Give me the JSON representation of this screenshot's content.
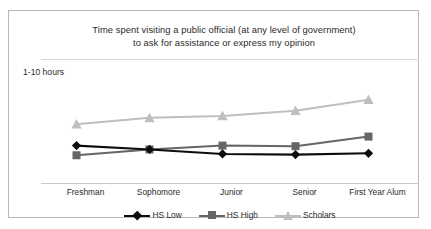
{
  "chart_data": {
    "type": "line",
    "title": "Time spent visiting a public official (at any level of government) to ask for assistance or express my opinion",
    "title_line1": "Time spent visiting a public official (at any level of government)",
    "title_line2": "to ask for assistance or express my opinion",
    "ylabel": "1-10 hours",
    "xlabel": "",
    "grid": false,
    "legend_position": "bottom",
    "ylim": [
      1,
      10
    ],
    "categories": [
      "Freshman",
      "Sophomore",
      "Junior",
      "Senior",
      "First Year Alum"
    ],
    "series": [
      {
        "name": "HS Low",
        "color": "#0d0d0d",
        "marker": "diamond",
        "values": [
          3.05,
          2.75,
          2.4,
          2.35,
          2.45
        ]
      },
      {
        "name": "HS High",
        "color": "#666666",
        "marker": "square",
        "values": [
          2.3,
          2.75,
          3.05,
          3.0,
          3.75
        ]
      },
      {
        "name": "Scholars",
        "color": "#bfbfbf",
        "marker": "triangle",
        "values": [
          4.7,
          5.2,
          5.35,
          5.75,
          6.6
        ]
      }
    ]
  },
  "axis": {
    "x_tick_labels": [
      "Freshman",
      "Sophomore",
      "Junior",
      "Senior",
      "First Year Alum"
    ]
  },
  "legend": {
    "entries": [
      {
        "label": "HS Low",
        "color": "#0d0d0d",
        "marker": "diamond"
      },
      {
        "label": "HS High",
        "color": "#666666",
        "marker": "square"
      },
      {
        "label": "Scholars",
        "color": "#bfbfbf",
        "marker": "triangle"
      }
    ]
  },
  "colors": {
    "hs_low": "#0d0d0d",
    "hs_high": "#666666",
    "scholars": "#bfbfbf",
    "border": "#b9b9b9",
    "axis": "#c9c9c9",
    "text": "#2b2b2b",
    "background": "#ffffff"
  }
}
